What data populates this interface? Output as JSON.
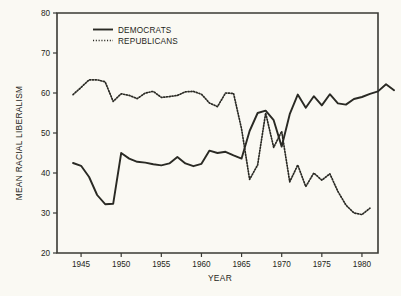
{
  "chart_data": {
    "type": "line",
    "title": "",
    "xlabel": "YEAR",
    "ylabel": "MEAN RACIAL LIBERALISM",
    "xlim": [
      1942,
      1982
    ],
    "ylim": [
      20,
      80
    ],
    "xticks": [
      1945,
      1950,
      1955,
      1960,
      1965,
      1970,
      1975,
      1980
    ],
    "xtick_labels": [
      "1945",
      "1950",
      "1955",
      "1960",
      "1965",
      "1970",
      "1975",
      "1980"
    ],
    "yticks": [
      20,
      30,
      40,
      50,
      60,
      70,
      80
    ],
    "ytick_labels": [
      "20",
      "30",
      "40",
      "50",
      "60",
      "70",
      "80"
    ],
    "grid": false,
    "legend_position": "top-left",
    "series": [
      {
        "name": "DEMOCRATS",
        "style": "solid",
        "x": [
          1944,
          1945,
          1946,
          1947,
          1948,
          1949,
          1950,
          1951,
          1952,
          1953,
          1954,
          1955,
          1956,
          1957,
          1958,
          1959,
          1960,
          1961,
          1962,
          1963,
          1964,
          1965,
          1966,
          1967,
          1968,
          1969,
          1970,
          1971,
          1972,
          1973,
          1974,
          1975,
          1976,
          1977,
          1978,
          1979,
          1980
        ],
        "values": [
          42.5,
          41.8,
          39.0,
          34.5,
          32.2,
          32.3,
          45.0,
          43.6,
          42.8,
          42.6,
          42.2,
          41.9,
          42.4,
          44.0,
          42.4,
          41.7,
          42.3,
          45.6,
          45.0,
          45.3,
          44.4,
          43.6,
          50.5,
          55.0,
          55.6,
          53.2,
          46.6,
          54.7,
          59.6,
          56.3,
          59.2,
          56.9,
          59.7,
          57.4,
          57.1,
          58.5,
          59.0
        ],
        "values_tail": [
          59.8,
          60.4,
          62.2,
          60.7
        ]
      },
      {
        "name": "REPUBLICANS",
        "style": "dotted",
        "x": [
          1944,
          1945,
          1946,
          1947,
          1948,
          1949,
          1950,
          1951,
          1952,
          1953,
          1954,
          1955,
          1956,
          1957,
          1958,
          1959,
          1960,
          1961,
          1962,
          1963,
          1964,
          1965,
          1966,
          1967,
          1968,
          1969,
          1970,
          1971,
          1972,
          1973,
          1974,
          1975,
          1976,
          1977,
          1978,
          1979
        ],
        "values": [
          59.6,
          61.4,
          63.3,
          63.3,
          62.8,
          57.9,
          59.8,
          59.4,
          58.6,
          60.0,
          60.4,
          58.9,
          59.1,
          59.4,
          60.3,
          60.4,
          59.7,
          57.5,
          56.6,
          60.0,
          59.9,
          51.0,
          38.4,
          42.0,
          55.0,
          46.4,
          50.4,
          37.8,
          42.0,
          36.6,
          40.0,
          38.2,
          39.8,
          35.4,
          32.0,
          30.0
        ],
        "values_tail": [
          29.6,
          31.2
        ]
      }
    ]
  },
  "legend": {
    "items": [
      {
        "label": "DEMOCRATS",
        "style": "solid"
      },
      {
        "label": "REPUBLICANS",
        "style": "dotted"
      }
    ]
  },
  "colors": {
    "background": "#faf9f3",
    "ink": "#2a2a24",
    "axis": "#3a3a34"
  }
}
